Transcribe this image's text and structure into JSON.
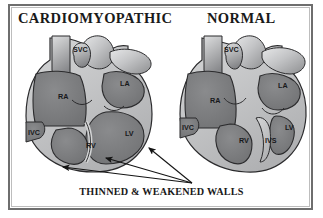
{
  "figure": {
    "kind": "medical-illustration",
    "background_color": "#ffffff",
    "frame_color": "#6e6e6e"
  },
  "titles": {
    "left": "CARDIOMYOPATHIC",
    "right": "NORMAL"
  },
  "caption": {
    "text": "THINNED & WEAKENED WALLS"
  },
  "palette": {
    "chamber_fill": "#7f8082",
    "chamber_fill_dark": "#6c6d70",
    "wall_fill": "#c2c3c5",
    "wall_light": "#d8d9da",
    "vessel_light": "#cfd0d2",
    "vessel_mid": "#9b9c9e",
    "outline": "#2b2b2d",
    "text": "#1a1a1a"
  },
  "hearts": [
    {
      "id": "cardiomyopathic",
      "name": "Cardiomyopathic heart",
      "description": "Dilated, globular heart with thinned and weakened ventricular walls",
      "labels": [
        {
          "abbr": "SVC",
          "meaning": "superior vena cava",
          "x": 61,
          "y": 22
        },
        {
          "abbr": "RA",
          "meaning": "right atrium",
          "x": 46,
          "y": 69
        },
        {
          "abbr": "LA",
          "meaning": "left atrium",
          "x": 108,
          "y": 56
        },
        {
          "abbr": "IVC",
          "meaning": "inferior vena cava",
          "x": 16,
          "y": 105
        },
        {
          "abbr": "RV",
          "meaning": "right ventricle",
          "x": 74,
          "y": 118
        },
        {
          "abbr": "LV",
          "meaning": "left ventricle",
          "x": 113,
          "y": 106
        }
      ]
    },
    {
      "id": "normal",
      "name": "Normal heart",
      "description": "Normal heart with thick ventricular walls and intact interventricular septum",
      "labels": [
        {
          "abbr": "SVC",
          "meaning": "superior vena cava",
          "x": 56,
          "y": 22
        },
        {
          "abbr": "RA",
          "meaning": "right atrium",
          "x": 42,
          "y": 73
        },
        {
          "abbr": "LA",
          "meaning": "left atrium",
          "x": 110,
          "y": 58
        },
        {
          "abbr": "IVC",
          "meaning": "inferior vena cava",
          "x": 14,
          "y": 100
        },
        {
          "abbr": "RV",
          "meaning": "right ventricle",
          "x": 71,
          "y": 113
        },
        {
          "abbr": "IVS",
          "meaning": "interventricular septum",
          "x": 97,
          "y": 113
        },
        {
          "abbr": "LV",
          "meaning": "left ventricle",
          "x": 117,
          "y": 100
        }
      ]
    }
  ],
  "annotations": {
    "pointer_origin": {
      "x": 192,
      "y": 183
    },
    "arrows": [
      {
        "target_x": 148,
        "target_y": 147,
        "points_to": "lateral left-ventricular wall"
      },
      {
        "target_x": 105,
        "target_y": 157,
        "points_to": "inferior ventricular wall"
      },
      {
        "target_x": 62,
        "target_y": 166,
        "points_to": "apex and posterior wall"
      }
    ]
  }
}
